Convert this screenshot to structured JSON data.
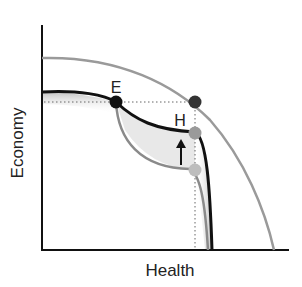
{
  "diagram": {
    "xlabel": "Health",
    "ylabel": "Economy",
    "points": {
      "E": {
        "label": "E",
        "color": "#111111"
      },
      "outer": {
        "label": "",
        "color": "#333333"
      },
      "H": {
        "label": "H",
        "color": "#9a9a9a"
      },
      "low": {
        "label": "",
        "color": "#bdbdbd"
      }
    },
    "curves": {
      "outer_frontier": {
        "color": "#9a9a9a"
      },
      "current_frontier": {
        "color": "#111111"
      },
      "inner_frontier": {
        "color": "#8a8a8a"
      }
    },
    "arrow": {
      "direction": "up",
      "color": "#111111"
    }
  }
}
